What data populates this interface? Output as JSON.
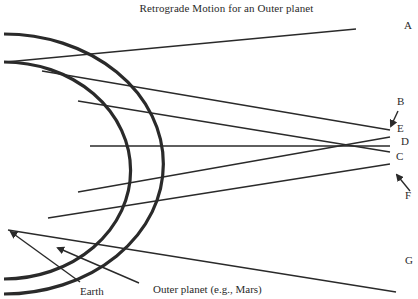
{
  "title": "Retrograde Motion for an Outer planet",
  "colors": {
    "ink": "#2a2a2a",
    "background": "#ffffff"
  },
  "orbits": {
    "earth": {
      "label": "Earth",
      "path": "M 4 62 A 126 108 0 0 1 4 279",
      "stroke_width": 3.2
    },
    "outer_planet": {
      "label": "Outer planet (e.g., Mars)",
      "path": "M 4 34 A 152 124 0 0 1 4 294",
      "stroke_width": 3.2
    }
  },
  "sight_lines": [
    {
      "id": "A",
      "x1": 6,
      "y1": 62,
      "x2": 356,
      "y2": 29
    },
    {
      "id": "B",
      "x1": 42,
      "y1": 71,
      "x2": 390,
      "y2": 130
    },
    {
      "id": "E",
      "x1": 78,
      "y1": 101,
      "x2": 390,
      "y2": 152
    },
    {
      "id": "D",
      "x1": 90,
      "y1": 146,
      "x2": 390,
      "y2": 146
    },
    {
      "id": "E2",
      "x1": 78,
      "y1": 192,
      "x2": 390,
      "y2": 137
    },
    {
      "id": "C",
      "x1": 48,
      "y1": 218,
      "x2": 390,
      "y2": 164
    },
    {
      "id": "G",
      "x1": 8,
      "y1": 230,
      "x2": 396,
      "y2": 292
    }
  ],
  "point_labels": [
    {
      "id": "A",
      "text": "A",
      "x": 408,
      "y": 25
    },
    {
      "id": "B",
      "text": "B",
      "x": 401,
      "y": 101
    },
    {
      "id": "E",
      "text": "E",
      "x": 401,
      "y": 128
    },
    {
      "id": "D",
      "text": "D",
      "x": 405,
      "y": 141
    },
    {
      "id": "C",
      "text": "C",
      "x": 400,
      "y": 156
    },
    {
      "id": "F",
      "text": "F",
      "x": 409,
      "y": 195
    },
    {
      "id": "G",
      "text": "G",
      "x": 409,
      "y": 260
    }
  ],
  "arrows": [
    {
      "id": "B-arrow",
      "x1": 398,
      "y1": 111,
      "x2": 391,
      "y2": 126
    },
    {
      "id": "F-arrow",
      "x1": 410,
      "y1": 191,
      "x2": 397,
      "y2": 175
    },
    {
      "id": "earth-arrow",
      "x1": 80,
      "y1": 282,
      "x2": 11,
      "y2": 232
    },
    {
      "id": "outer-arrow",
      "x1": 139,
      "y1": 283,
      "x2": 58,
      "y2": 248
    }
  ],
  "annotations": {
    "earth": {
      "text": "Earth",
      "x": 80,
      "y": 286
    },
    "outer_planet": {
      "text": "Outer planet (e.g., Mars)",
      "x": 153,
      "y": 284
    }
  }
}
